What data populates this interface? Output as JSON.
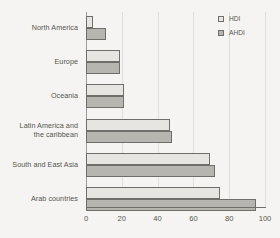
{
  "chart_data": {
    "type": "bar",
    "orientation": "horizontal",
    "title": "",
    "xlabel": "",
    "ylabel": "",
    "xlim": [
      0,
      100
    ],
    "xticks": [
      0,
      20,
      40,
      60,
      80,
      100
    ],
    "grid": true,
    "legend_position": "top-right",
    "categories": [
      "North America",
      "Europe",
      "Oceania",
      "Latin America and the caribbean",
      "South and East Asia",
      "Arab countries"
    ],
    "category_lines": [
      [
        "North America"
      ],
      [
        "Europe"
      ],
      [
        "Oceania"
      ],
      [
        "Latin America and",
        "the caribbean"
      ],
      [
        "South and East Asia"
      ],
      [
        "Arab countries"
      ]
    ],
    "series": [
      {
        "name": "HDI",
        "color": "#e6e5e1",
        "values": [
          4,
          19,
          21,
          47,
          69,
          75
        ]
      },
      {
        "name": "AHDI",
        "color": "#b6b5b0",
        "values": [
          11,
          19,
          21,
          48,
          72,
          95
        ]
      }
    ]
  },
  "legend": {
    "items": [
      {
        "label": "HDI"
      },
      {
        "label": "AHDI"
      }
    ]
  },
  "axis": {
    "tick_labels": [
      "0",
      "20",
      "40",
      "60",
      "80",
      "100"
    ]
  },
  "colors": {
    "background": "#f5f4f2",
    "hdi_fill": "#e6e5e1",
    "ahdi_fill": "#b6b5b0",
    "bar_border": "#6e6e6a",
    "gridline": "#dededa",
    "text": "#55544f"
  }
}
